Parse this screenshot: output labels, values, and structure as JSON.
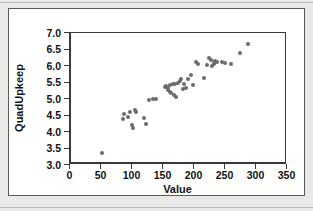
{
  "chart_data": {
    "type": "scatter",
    "title": "",
    "xlabel": "Value",
    "ylabel": "QuadUpkeep",
    "xlim": [
      0,
      350
    ],
    "ylim": [
      3.0,
      7.0
    ],
    "xticks": [
      0,
      50,
      100,
      150,
      200,
      250,
      300,
      350
    ],
    "yticks": [
      3.0,
      3.5,
      4.0,
      4.5,
      5.0,
      5.5,
      6.0,
      6.5,
      7.0
    ],
    "xtick_labels": [
      "0",
      "50",
      "100",
      "150",
      "200",
      "250",
      "300",
      "350"
    ],
    "ytick_labels": [
      "3.0",
      "3.5",
      "4.0",
      "4.5",
      "5.0",
      "5.5",
      "6.0",
      "6.5",
      "7.0"
    ],
    "grid": false,
    "legend": null,
    "marker_color": "#6b6b6b",
    "marker_size": 4,
    "points": [
      {
        "x": 50,
        "y": 3.35
      },
      {
        "x": 84,
        "y": 4.38
      },
      {
        "x": 86,
        "y": 4.54
      },
      {
        "x": 92,
        "y": 4.45
      },
      {
        "x": 95,
        "y": 4.6
      },
      {
        "x": 98,
        "y": 4.22
      },
      {
        "x": 100,
        "y": 4.12
      },
      {
        "x": 103,
        "y": 4.68
      },
      {
        "x": 105,
        "y": 4.62
      },
      {
        "x": 118,
        "y": 4.42
      },
      {
        "x": 121,
        "y": 4.24
      },
      {
        "x": 126,
        "y": 4.96
      },
      {
        "x": 133,
        "y": 5.0
      },
      {
        "x": 137,
        "y": 5.0
      },
      {
        "x": 152,
        "y": 5.36
      },
      {
        "x": 154,
        "y": 5.4
      },
      {
        "x": 156,
        "y": 5.26
      },
      {
        "x": 157,
        "y": 5.34
      },
      {
        "x": 159,
        "y": 5.2
      },
      {
        "x": 160,
        "y": 5.42
      },
      {
        "x": 162,
        "y": 5.18
      },
      {
        "x": 164,
        "y": 5.46
      },
      {
        "x": 166,
        "y": 5.12
      },
      {
        "x": 168,
        "y": 5.44
      },
      {
        "x": 170,
        "y": 5.06
      },
      {
        "x": 172,
        "y": 5.48
      },
      {
        "x": 175,
        "y": 5.56
      },
      {
        "x": 178,
        "y": 5.62
      },
      {
        "x": 180,
        "y": 5.3
      },
      {
        "x": 182,
        "y": 5.46
      },
      {
        "x": 185,
        "y": 5.34
      },
      {
        "x": 188,
        "y": 5.6
      },
      {
        "x": 193,
        "y": 5.74
      },
      {
        "x": 197,
        "y": 5.42
      },
      {
        "x": 201,
        "y": 6.12
      },
      {
        "x": 205,
        "y": 6.06
      },
      {
        "x": 214,
        "y": 5.64
      },
      {
        "x": 219,
        "y": 6.04
      },
      {
        "x": 222,
        "y": 6.24
      },
      {
        "x": 226,
        "y": 6.18
      },
      {
        "x": 228,
        "y": 6.0
      },
      {
        "x": 230,
        "y": 6.08
      },
      {
        "x": 231,
        "y": 6.06
      },
      {
        "x": 233,
        "y": 6.14
      },
      {
        "x": 236,
        "y": 6.12
      },
      {
        "x": 243,
        "y": 6.12
      },
      {
        "x": 248,
        "y": 6.1
      },
      {
        "x": 258,
        "y": 6.06
      },
      {
        "x": 272,
        "y": 6.4
      },
      {
        "x": 286,
        "y": 6.68
      }
    ]
  }
}
